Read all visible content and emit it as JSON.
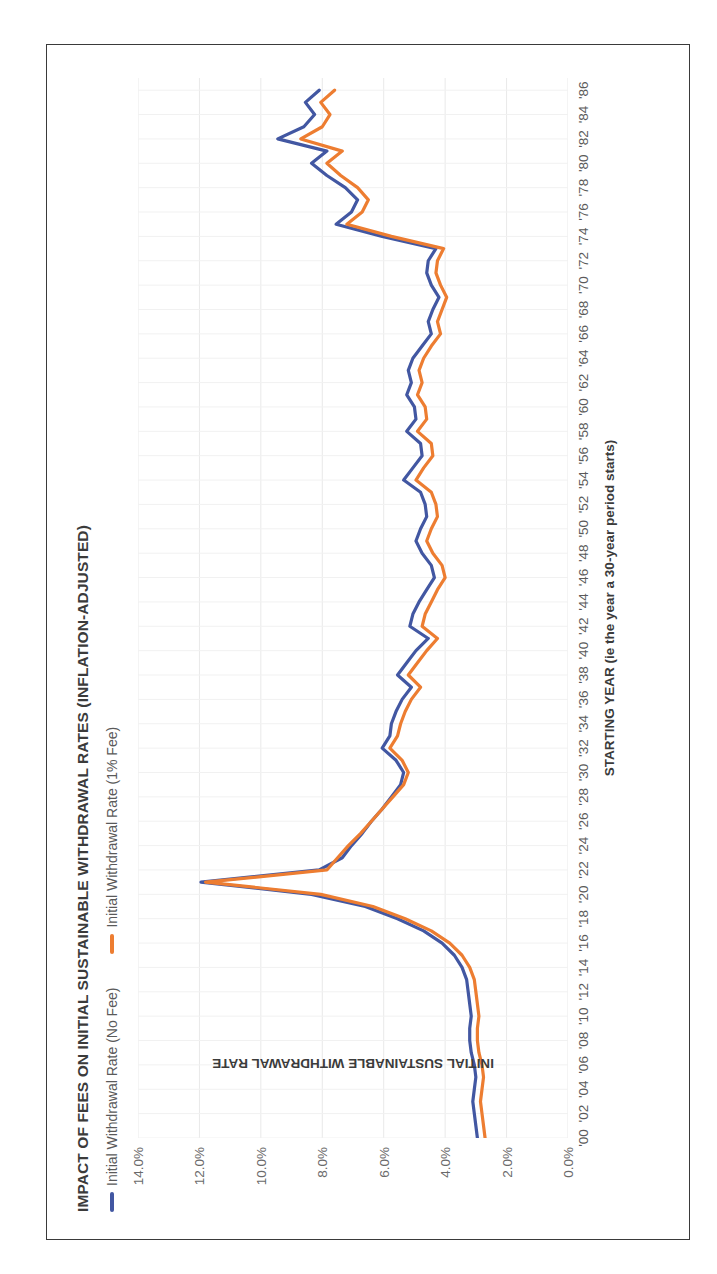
{
  "figure": {
    "border_color": "#3a3a3a",
    "background": "#ffffff"
  },
  "chart_data": {
    "type": "line",
    "title": "IMPACT OF FEES ON INITIAL SUSTAINABLE WITHDRAWAL RATES (INFLATION-ADJUSTED)",
    "xlabel": "STARTING YEAR (ie the year a 30-year period starts)",
    "ylabel": "INITIAL SUSTAINABLE WITHDRAWAL RATE",
    "grid": true,
    "legend_position": "top-left",
    "orientation": "rotated-90-ccw",
    "xlim": [
      1900,
      1987
    ],
    "ylim": [
      0,
      14
    ],
    "ytick_labels": [
      "0.0%",
      "2.0%",
      "4.0%",
      "6.0%",
      "8.0%",
      "10.0%",
      "12.0%",
      "14.0%"
    ],
    "ytick_values": [
      0,
      2,
      4,
      6,
      8,
      10,
      12,
      14
    ],
    "xtick_labels": [
      "'00",
      "'02",
      "'04",
      "'06",
      "'08",
      "'10",
      "'12",
      "'14",
      "'16",
      "'18",
      "'20",
      "'22",
      "'24",
      "'26",
      "'28",
      "'30",
      "'32",
      "'34",
      "'36",
      "'38",
      "'40",
      "'42",
      "'44",
      "'46",
      "'48",
      "'50",
      "'52",
      "'54",
      "'56",
      "'58",
      "'60",
      "'62",
      "'64",
      "'66",
      "'68",
      "'70",
      "'72",
      "'74",
      "'76",
      "'78",
      "'80",
      "'82",
      "'84",
      "'86"
    ],
    "xtick_values": [
      1900,
      1902,
      1904,
      1906,
      1908,
      1910,
      1912,
      1914,
      1916,
      1918,
      1920,
      1922,
      1924,
      1926,
      1928,
      1930,
      1932,
      1934,
      1936,
      1938,
      1940,
      1942,
      1944,
      1946,
      1948,
      1950,
      1952,
      1954,
      1956,
      1958,
      1960,
      1962,
      1964,
      1966,
      1968,
      1970,
      1972,
      1974,
      1976,
      1978,
      1980,
      1982,
      1984,
      1986
    ],
    "x": [
      1900,
      1901,
      1902,
      1903,
      1904,
      1905,
      1906,
      1907,
      1908,
      1909,
      1910,
      1911,
      1912,
      1913,
      1914,
      1915,
      1916,
      1917,
      1918,
      1919,
      1920,
      1921,
      1922,
      1923,
      1924,
      1925,
      1926,
      1927,
      1928,
      1929,
      1930,
      1931,
      1932,
      1933,
      1934,
      1935,
      1936,
      1937,
      1938,
      1939,
      1940,
      1941,
      1942,
      1943,
      1944,
      1945,
      1946,
      1947,
      1948,
      1949,
      1950,
      1951,
      1952,
      1953,
      1954,
      1955,
      1956,
      1957,
      1958,
      1959,
      1960,
      1961,
      1962,
      1963,
      1964,
      1965,
      1966,
      1967,
      1968,
      1969,
      1970,
      1971,
      1972,
      1973,
      1974,
      1975,
      1976,
      1977,
      1978,
      1979,
      1980,
      1981,
      1982,
      1983,
      1984,
      1985,
      1986
    ],
    "series": [
      {
        "name": "Initial Withdrawal Rate (No Fee)",
        "color": "#4257a2",
        "values": [
          2.95,
          3.0,
          3.05,
          3.1,
          3.05,
          3.0,
          3.05,
          3.15,
          3.2,
          3.2,
          3.15,
          3.2,
          3.25,
          3.3,
          3.45,
          3.7,
          4.1,
          4.7,
          5.55,
          6.6,
          8.35,
          11.95,
          8.1,
          7.35,
          7.05,
          6.7,
          6.4,
          6.05,
          5.75,
          5.45,
          5.35,
          5.6,
          6.05,
          5.8,
          5.75,
          5.6,
          5.4,
          5.1,
          5.55,
          5.25,
          4.95,
          4.55,
          5.15,
          5.05,
          4.85,
          4.6,
          4.35,
          4.45,
          4.75,
          4.95,
          4.8,
          4.6,
          4.65,
          4.8,
          5.35,
          5.05,
          4.75,
          4.8,
          5.25,
          4.95,
          5.0,
          5.25,
          5.1,
          5.2,
          5.05,
          4.75,
          4.45,
          4.55,
          4.4,
          4.2,
          4.45,
          4.6,
          4.55,
          4.3,
          6.05,
          7.55,
          7.05,
          6.85,
          7.25,
          7.85,
          8.35,
          7.85,
          9.45,
          8.6,
          8.25,
          8.55,
          8.1
        ],
        "linewidth": 3.2
      },
      {
        "name": "Initial Withdrawal Rate (1% Fee)",
        "color": "#ed7d31",
        "values": [
          2.7,
          2.75,
          2.8,
          2.85,
          2.8,
          2.75,
          2.8,
          2.9,
          2.95,
          2.95,
          2.9,
          2.95,
          3.0,
          3.05,
          3.2,
          3.45,
          3.85,
          4.45,
          5.3,
          6.35,
          8.05,
          11.8,
          7.85,
          7.5,
          7.15,
          6.75,
          6.4,
          6.05,
          5.7,
          5.35,
          5.2,
          5.4,
          5.8,
          5.55,
          5.45,
          5.3,
          5.1,
          4.8,
          5.2,
          4.9,
          4.6,
          4.25,
          4.75,
          4.65,
          4.45,
          4.25,
          4.0,
          4.1,
          4.4,
          4.6,
          4.45,
          4.25,
          4.3,
          4.45,
          4.95,
          4.7,
          4.4,
          4.45,
          4.9,
          4.6,
          4.65,
          4.9,
          4.75,
          4.85,
          4.7,
          4.45,
          4.15,
          4.25,
          4.1,
          3.95,
          4.15,
          4.3,
          4.25,
          4.05,
          5.75,
          7.2,
          6.7,
          6.5,
          6.85,
          7.4,
          7.85,
          7.35,
          8.7,
          8.0,
          7.75,
          8.05,
          7.6
        ],
        "linewidth": 3.2
      }
    ]
  },
  "legend": {
    "items": [
      {
        "label": "Initial Withdrawal Rate (No Fee)",
        "color": "#4257a2"
      },
      {
        "label": "Initial Withdrawal Rate (1% Fee)",
        "color": "#ed7d31"
      }
    ]
  }
}
